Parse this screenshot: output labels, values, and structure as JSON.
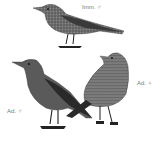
{
  "plate": {
    "subject": "Rock thrush plumage plate",
    "figures": [
      {
        "id": "immature-male",
        "label": "Imm. ♂",
        "plumage": "speckled grey-brown"
      },
      {
        "id": "adult-male",
        "label": "Ad. ♂",
        "plumage": "uniform dark slate"
      },
      {
        "id": "adult-female",
        "label": "Ad. ♀",
        "plumage": "scaled grey-brown"
      }
    ]
  },
  "colors": {
    "background": "#ffffff",
    "label_text": "#777777",
    "adult_male_body": "#5a5a5a",
    "adult_male_wing": "#2a2a2a",
    "immature_body": "#6e6e6e",
    "female_body": "#7a7a7a",
    "legs": "#1e1e1e"
  }
}
